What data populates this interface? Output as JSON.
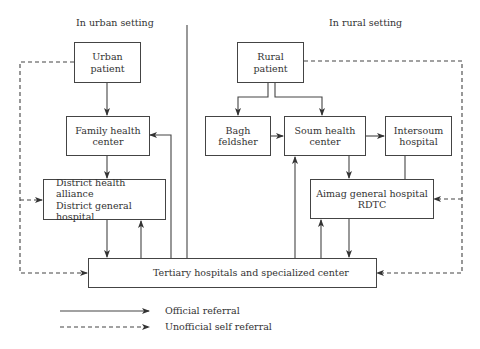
{
  "headings": {
    "urban": "In urban setting",
    "rural": "In rural setting"
  },
  "nodes": {
    "urban_patient": [
      "Urban",
      "patient"
    ],
    "family_health_center": [
      "Family health",
      "center"
    ],
    "district": [
      "District health alliance",
      "District general hospital"
    ],
    "tertiary": [
      "Tertiary hospitals and specialized center"
    ],
    "rural_patient": [
      "Rural",
      "patient"
    ],
    "bagh_feldsher": [
      "Bagh",
      "feldsher"
    ],
    "soum_health_center": [
      "Soum health",
      "center"
    ],
    "intersoum_hospital": [
      "Intersoum",
      "hospital"
    ],
    "aimag": [
      "Aimag general hospital",
      "RDTC"
    ]
  },
  "legend": {
    "official": "Official referral",
    "unofficial": "Unofficial self referral"
  },
  "edges": [
    {
      "from": "Urban patient",
      "to": "Family health center",
      "type": "official"
    },
    {
      "from": "Family health center",
      "to": "District health alliance / District general hospital",
      "type": "official"
    },
    {
      "from": "District health alliance / District general hospital",
      "to": "Tertiary hospitals and specialized center",
      "type": "official"
    },
    {
      "from": "Tertiary hospitals and specialized center",
      "to": "District health alliance / District general hospital",
      "type": "official"
    },
    {
      "from": "Tertiary hospitals and specialized center",
      "to": "Family health center",
      "type": "official"
    },
    {
      "from": "Urban patient",
      "to": "District health alliance / District general hospital",
      "type": "unofficial"
    },
    {
      "from": "Urban patient",
      "to": "Tertiary hospitals and specialized center",
      "type": "unofficial"
    },
    {
      "from": "Rural patient",
      "to": "Bagh feldsher",
      "type": "official"
    },
    {
      "from": "Rural patient",
      "to": "Soum health center",
      "type": "official"
    },
    {
      "from": "Bagh feldsher",
      "to": "Soum health center",
      "type": "official"
    },
    {
      "from": "Soum health center",
      "to": "Intersoum hospital",
      "type": "official"
    },
    {
      "from": "Soum health center",
      "to": "Aimag general hospital RDTC",
      "type": "official"
    },
    {
      "from": "Intersoum hospital",
      "to": "Aimag general hospital RDTC",
      "type": "official"
    },
    {
      "from": "Aimag general hospital RDTC",
      "to": "Tertiary hospitals and specialized center",
      "type": "official"
    },
    {
      "from": "Tertiary hospitals and specialized center",
      "to": "Aimag general hospital RDTC",
      "type": "official"
    },
    {
      "from": "Tertiary hospitals and specialized center",
      "to": "Soum health center",
      "type": "official"
    },
    {
      "from": "Rural patient",
      "to": "Aimag general hospital RDTC",
      "type": "unofficial"
    },
    {
      "from": "Rural patient",
      "to": "Tertiary hospitals and specialized center",
      "type": "unofficial"
    }
  ]
}
